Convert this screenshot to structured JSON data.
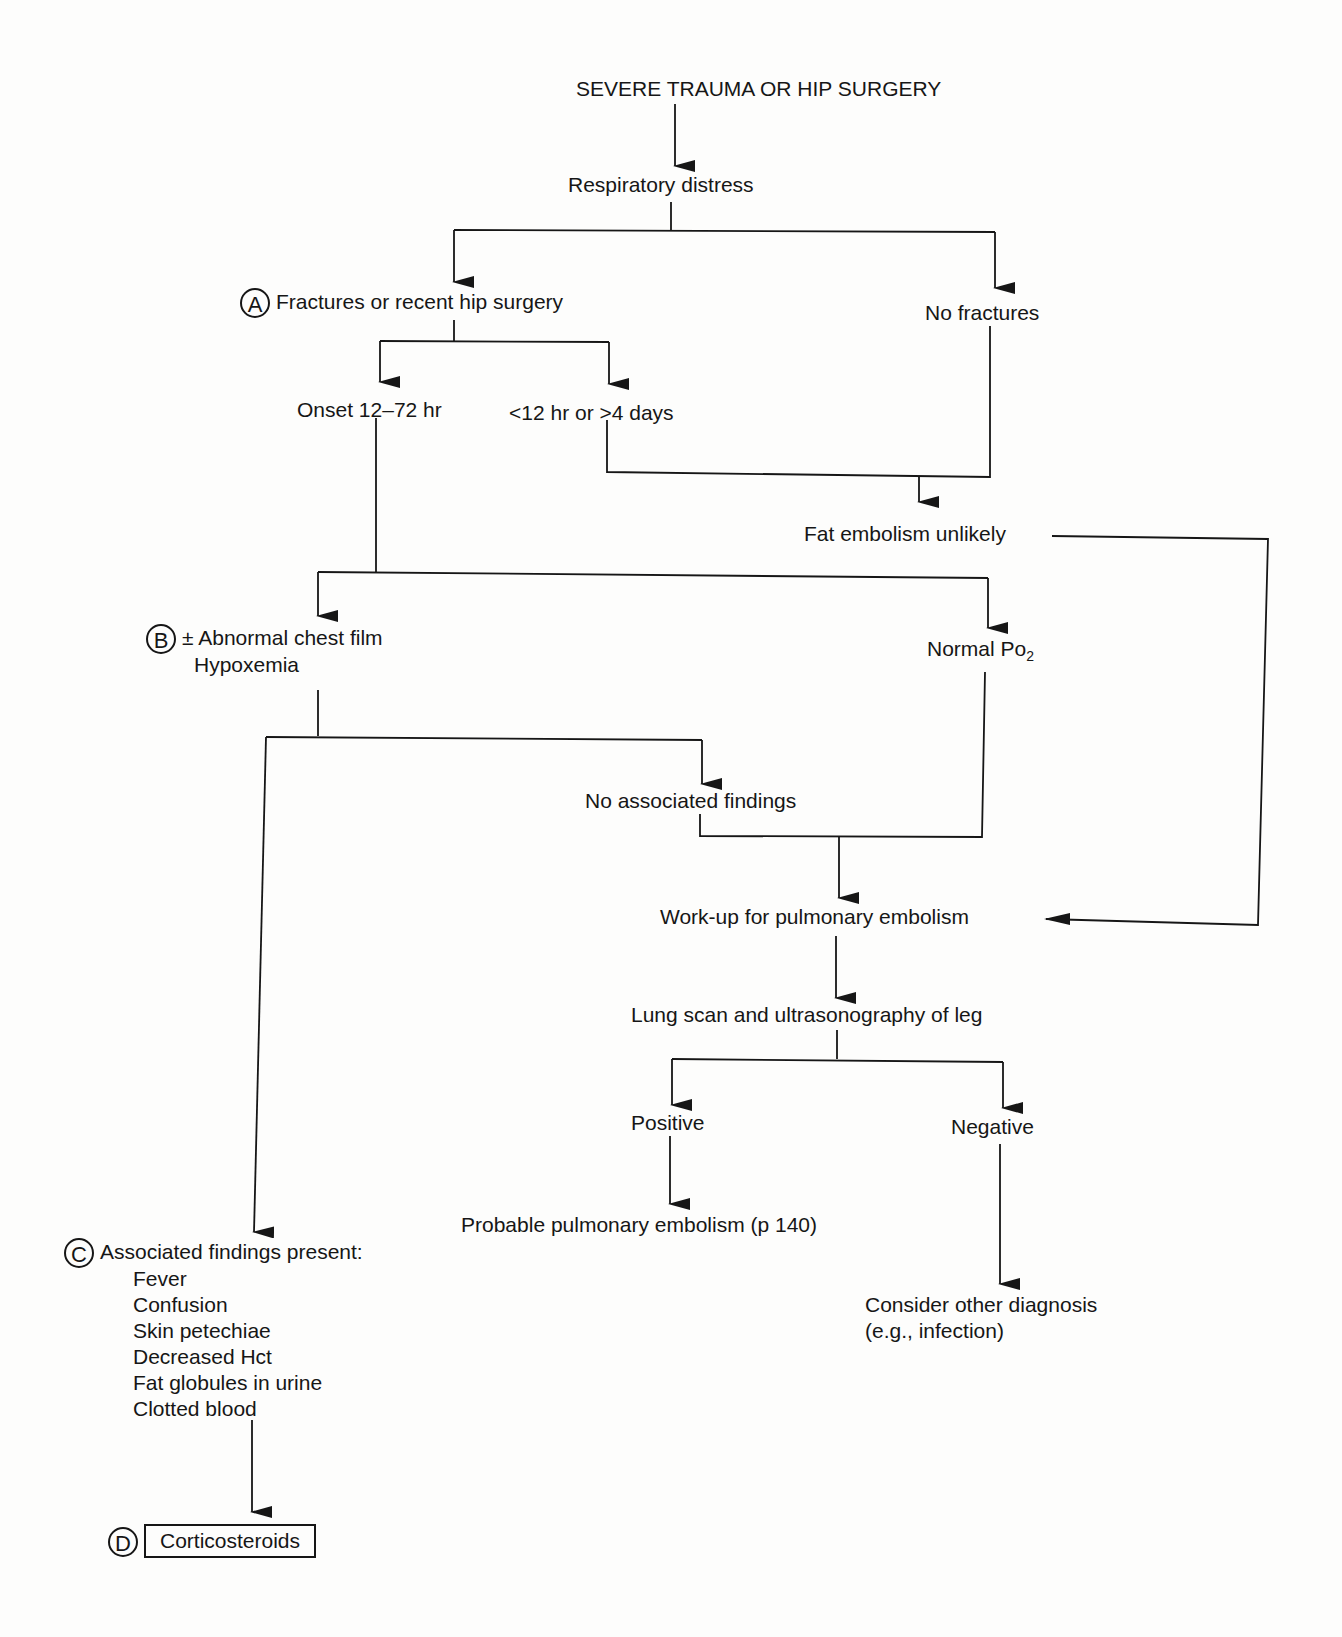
{
  "nodes": {
    "start": "SEVERE TRAUMA OR HIP SURGERY",
    "resp": "Respiratory distress",
    "fractures": "Fractures or recent hip surgery",
    "no_fractures": "No fractures",
    "onset": "Onset 12–72 hr",
    "early_late": "<12 hr or >4 days",
    "fat_unlikely": "Fat embolism unlikely",
    "chest_film": "± Abnormal chest film",
    "hypoxemia": "Hypoxemia",
    "normal_po2": "Normal Po",
    "normal_po2_sub": "2",
    "no_assoc": "No associated findings",
    "workup": "Work-up for pulmonary embolism",
    "lung_scan": "Lung scan and ultrasonography of leg",
    "positive": "Positive",
    "negative": "Negative",
    "probable_pe": "Probable pulmonary embolism (p 140)",
    "consider_1": "Consider other diagnosis",
    "consider_2": "(e.g., infection)",
    "assoc_present": "Associated findings present:",
    "corticosteroids": "Corticosteroids"
  },
  "findings": [
    "Fever",
    "Confusion",
    "Skin petechiae",
    "Decreased Hct",
    "Fat globules in urine",
    "Clotted blood"
  ],
  "markers": {
    "a": "A",
    "b": "B",
    "c": "C",
    "d": "D"
  }
}
